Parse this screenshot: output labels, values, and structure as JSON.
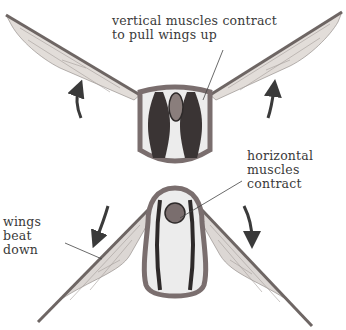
{
  "diagram": {
    "type": "insect indirect flight muscles",
    "colors": {
      "thorax_wall": "#7a6e6e",
      "thorax_fill": "#ececec",
      "muscle": "#2e2a2a",
      "wing": "#d8d3d0",
      "arrow": "#3a3a3a",
      "text": "#3a3a3a",
      "leader_line": "#444444"
    },
    "panels": [
      {
        "name": "upstroke",
        "arrow_direction": "up",
        "active_muscles": "vertical"
      },
      {
        "name": "downstroke",
        "arrow_direction": "down",
        "active_muscles": "horizontal"
      }
    ]
  },
  "labels": {
    "vertical_line1": "vertical muscles contract",
    "vertical_line2": "to pull wings up",
    "horizontal_line1": "horizontal",
    "horizontal_line2": "muscles",
    "horizontal_line3": "contract",
    "wings_line1": "wings",
    "wings_line2": "beat",
    "wings_line3": "down"
  }
}
